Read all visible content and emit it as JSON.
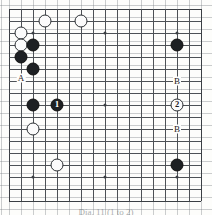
{
  "figure": {
    "kind": "go-board-diagram",
    "board_size": 17,
    "line_color": "#4d5156",
    "background_color": "#fdfdfb",
    "caption": "Dia. 11  (1 to 2)"
  },
  "chart_data": {
    "type": "table",
    "xlabel": "",
    "ylabel": "",
    "grid": true,
    "columns": [
      "color",
      "col",
      "row",
      "label"
    ],
    "board_lines": 17,
    "star_points": [
      {
        "col": 3,
        "row": 3
      },
      {
        "col": 9,
        "row": 3
      },
      {
        "col": 15,
        "row": 3
      },
      {
        "col": 3,
        "row": 9
      },
      {
        "col": 9,
        "row": 9
      },
      {
        "col": 15,
        "row": 9
      },
      {
        "col": 3,
        "row": 15
      },
      {
        "col": 9,
        "row": 15
      },
      {
        "col": 15,
        "row": 15
      }
    ],
    "stones": [
      {
        "color": "white",
        "col": 4,
        "row": 2,
        "label": ""
      },
      {
        "color": "white",
        "col": 7,
        "row": 2,
        "label": ""
      },
      {
        "color": "white",
        "col": 2,
        "row": 3,
        "label": ""
      },
      {
        "color": "white",
        "col": 2,
        "row": 4,
        "label": ""
      },
      {
        "color": "black",
        "col": 3,
        "row": 4,
        "label": ""
      },
      {
        "color": "black",
        "col": 2,
        "row": 5,
        "label": ""
      },
      {
        "color": "black",
        "col": 3,
        "row": 6,
        "label": ""
      },
      {
        "color": "black",
        "col": 15,
        "row": 4,
        "label": ""
      },
      {
        "color": "black",
        "col": 3,
        "row": 9,
        "label": ""
      },
      {
        "color": "black",
        "col": 5,
        "row": 9,
        "label": "1"
      },
      {
        "color": "white",
        "col": 3,
        "row": 11,
        "label": ""
      },
      {
        "color": "white",
        "col": 5,
        "row": 14,
        "label": ""
      },
      {
        "color": "white",
        "col": 15,
        "row": 9,
        "label": "2"
      },
      {
        "color": "black",
        "col": 15,
        "row": 14,
        "label": ""
      }
    ],
    "point_markers": [
      {
        "text": "A",
        "col": 2,
        "row": 6.75
      },
      {
        "text": "B",
        "col": 15,
        "row": 7.0
      },
      {
        "text": "B",
        "col": 15,
        "row": 11.0
      }
    ]
  }
}
